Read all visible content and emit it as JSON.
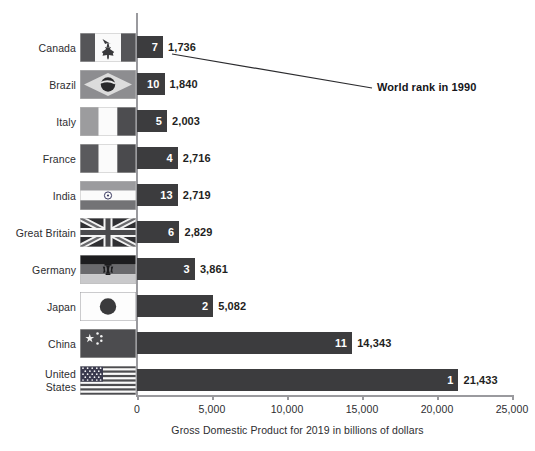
{
  "chart_data": {
    "type": "bar",
    "orientation": "horizontal",
    "title": "",
    "xlabel": "Gross Domestic Product for 2019 in billions of dollars",
    "ylabel": "",
    "xlim": [
      0,
      25000
    ],
    "xticks": [
      0,
      5000,
      10000,
      15000,
      20000,
      25000
    ],
    "xtick_labels": [
      "0",
      "5,000",
      "10,000",
      "15,000",
      "20,000",
      "25,000"
    ],
    "grid": false,
    "legend": null,
    "categories": [
      "Canada",
      "Brazil",
      "Italy",
      "France",
      "India",
      "Great Britain",
      "Germany",
      "Japan",
      "China",
      "United States"
    ],
    "values": [
      1736,
      1840,
      2003,
      2716,
      2719,
      2829,
      3861,
      5082,
      14343,
      21433
    ],
    "value_labels": [
      "1,736",
      "1,840",
      "2,003",
      "2,716",
      "2,719",
      "2,829",
      "3,861",
      "5,082",
      "14,343",
      "21,433"
    ],
    "rank_1990": [
      7,
      10,
      5,
      4,
      13,
      6,
      3,
      2,
      11,
      1
    ],
    "annotations": [
      {
        "text": "World rank in 1990",
        "points_to": "Canada rank badge"
      }
    ]
  },
  "rows": [
    {
      "country": "Canada",
      "country_line1": "Canada",
      "country_line2": "",
      "flag": "flag-canada-icon",
      "rank": "7",
      "value": "1,736",
      "value_num": 1736
    },
    {
      "country": "Brazil",
      "country_line1": "Brazil",
      "country_line2": "",
      "flag": "flag-brazil-icon",
      "rank": "10",
      "value": "1,840",
      "value_num": 1840
    },
    {
      "country": "Italy",
      "country_line1": "Italy",
      "country_line2": "",
      "flag": "flag-italy-icon",
      "rank": "5",
      "value": "2,003",
      "value_num": 2003
    },
    {
      "country": "France",
      "country_line1": "France",
      "country_line2": "",
      "flag": "flag-france-icon",
      "rank": "4",
      "value": "2,716",
      "value_num": 2716
    },
    {
      "country": "India",
      "country_line1": "India",
      "country_line2": "",
      "flag": "flag-india-icon",
      "rank": "13",
      "value": "2,719",
      "value_num": 2719
    },
    {
      "country": "Great Britain",
      "country_line1": "Great Britain",
      "country_line2": "",
      "flag": "flag-great-britain-icon",
      "rank": "6",
      "value": "2,829",
      "value_num": 2829
    },
    {
      "country": "Germany",
      "country_line1": "Germany",
      "country_line2": "",
      "flag": "flag-germany-icon",
      "rank": "3",
      "value": "3,861",
      "value_num": 3861
    },
    {
      "country": "Japan",
      "country_line1": "Japan",
      "country_line2": "",
      "flag": "flag-japan-icon",
      "rank": "2",
      "value": "5,082",
      "value_num": 5082
    },
    {
      "country": "China",
      "country_line1": "China",
      "country_line2": "",
      "flag": "flag-china-icon",
      "rank": "11",
      "value": "14,343",
      "value_num": 14343
    },
    {
      "country": "United States",
      "country_line1": "United",
      "country_line2": "States",
      "flag": "flag-united-states-icon",
      "rank": "1",
      "value": "21,433",
      "value_num": 21433
    }
  ],
  "axis": {
    "ticks": [
      "0",
      "5,000",
      "10,000",
      "15,000",
      "20,000",
      "25,000"
    ],
    "title": "Gross Domestic Product for 2019 in billions of dollars"
  },
  "annotation": {
    "label": "World rank in 1990"
  },
  "colors": {
    "bar": "#3c3c3e",
    "axis": "#9a9a9e",
    "text": "#2d2d30",
    "annotation": "#15151a",
    "background": "#ffffff"
  }
}
